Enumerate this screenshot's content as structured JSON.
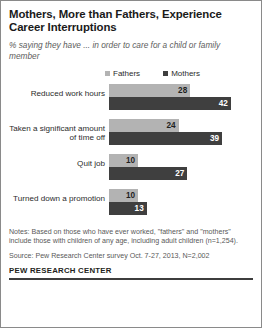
{
  "figure": {
    "title": "Mothers, More than Fathers, Experience Career Interruptions",
    "subtitle": "% saying they have ... in order to care for a child or family member",
    "notes": "Notes: Based on those who have ever worked, \"fathers\" and \"mothers\" include those with children of any age, including adult children (n=1,254).",
    "source": "Source: Pew Research Center survey Oct. 7-27, 2013, N=2,002",
    "brand": "PEW RESEARCH CENTER"
  },
  "colors": {
    "fathers": "#b3b3b3",
    "mothers": "#3f3f3f",
    "border": "#8a8a8a",
    "rule": "#3d3d3d"
  },
  "chart_data": {
    "type": "bar",
    "orientation": "horizontal",
    "title": "Mothers, More than Fathers, Experience Career Interruptions",
    "subtitle": "% saying they have ... in order to care for a child or family member",
    "xlabel": "",
    "ylabel": "",
    "xlim": [
      0,
      45
    ],
    "grid": false,
    "legend_position": "top",
    "categories": [
      "Reduced work hours",
      "Taken a significant amount of time off",
      "Quit job",
      "Turned down a promotion"
    ],
    "series": [
      {
        "name": "Fathers",
        "values": [
          28,
          24,
          10,
          10
        ]
      },
      {
        "name": "Mothers",
        "values": [
          42,
          39,
          27,
          13
        ]
      }
    ]
  }
}
